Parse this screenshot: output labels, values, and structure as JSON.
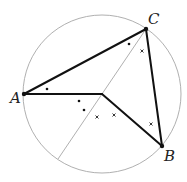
{
  "diagram": {
    "type": "geometry",
    "circle": {
      "cx": 102,
      "cy": 94,
      "r": 79,
      "stroke": "#b0b0b0"
    },
    "points": {
      "A": {
        "x": 24,
        "y": 94,
        "label": "A",
        "lx": 10,
        "ly": 103
      },
      "B": {
        "x": 162,
        "y": 146,
        "label": "B",
        "lx": 164,
        "ly": 161
      },
      "C": {
        "x": 146,
        "y": 29,
        "label": "C",
        "lx": 148,
        "ly": 24
      },
      "O": {
        "x": 102,
        "y": 94
      }
    },
    "triangle_edges": [
      [
        "A",
        "C"
      ],
      [
        "C",
        "B"
      ]
    ],
    "center_segments": [
      [
        "A",
        "O"
      ],
      [
        "O",
        "B"
      ]
    ],
    "diameter_line": {
      "x1": 146,
      "y1": 29,
      "x2": 58,
      "y2": 159,
      "stroke": "#b0b0b0"
    },
    "angle_marks": {
      "dots": [
        [
          47,
          89
        ],
        [
          129,
          44
        ],
        [
          79,
          101
        ],
        [
          84,
          110
        ]
      ],
      "crosses": [
        [
          142,
          51
        ],
        [
          97,
          117
        ],
        [
          114,
          115
        ],
        [
          151,
          124
        ]
      ]
    },
    "colors": {
      "edge": "#111111",
      "guide": "#b0b0b0"
    }
  }
}
